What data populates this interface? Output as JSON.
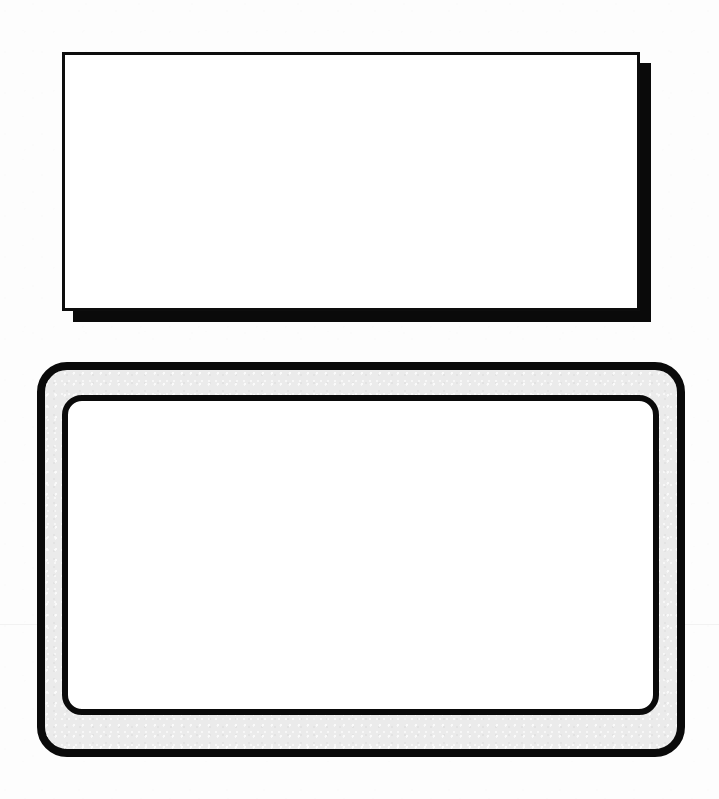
{
  "page": {
    "width": 719,
    "height": 799,
    "background_color": "#fdfdfd",
    "ink_color": "#0a0a0a",
    "scan_seam": {
      "y": 624,
      "color": "rgba(0,0,0,0.045)"
    }
  },
  "figures": [
    {
      "id": "top-rectangle",
      "name": "plain-rectangle-with-drop-shadow",
      "shape": "rectangle",
      "label": "",
      "fill_color": "#ffffff",
      "stroke_color": "#0d0d0d",
      "stroke_width": 3,
      "corner_radius": 0,
      "x": 62,
      "y": 52,
      "width": 578,
      "height": 259,
      "shadow": {
        "color": "#0a0a0a",
        "offset_x": 11,
        "offset_y": 11,
        "blur": 0
      }
    },
    {
      "id": "bottom-rounded-frame",
      "name": "rounded-rectangle-double-frame",
      "shape": "rounded-rectangle",
      "label": "",
      "outer": {
        "x": 37,
        "y": 362,
        "width": 648,
        "height": 395,
        "corner_radius": 30,
        "stroke_color": "#0a0a0a",
        "stroke_width": 8,
        "band_color": "#ebebeb"
      },
      "inner": {
        "x": 25,
        "y": 33,
        "width": 597,
        "height": 320,
        "corner_radius": 20,
        "stroke_color": "#0a0a0a",
        "stroke_width": 6,
        "fill_color": "#ffffff"
      },
      "shadow": null
    }
  ],
  "chart_data": {
    "type": "table",
    "columns": [
      "figure",
      "shape",
      "x",
      "y",
      "width",
      "height",
      "radius",
      "stroke"
    ],
    "rows": [
      [
        "top-rectangle",
        "rectangle",
        62,
        52,
        578,
        259,
        0,
        3
      ],
      [
        "bottom-outer-frame",
        "rounded-rectangle",
        37,
        362,
        648,
        395,
        30,
        8
      ],
      [
        "bottom-inner-frame",
        "rounded-rectangle",
        62,
        395,
        597,
        320,
        20,
        6
      ]
    ]
  }
}
